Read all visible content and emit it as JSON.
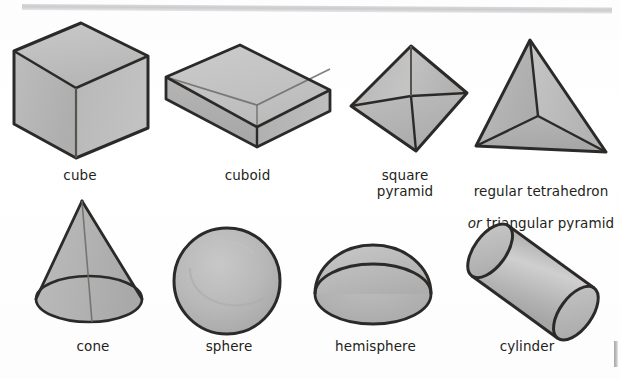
{
  "page": {
    "background_color": "#fefefe",
    "ink_color": "#231f20",
    "fill_color": "#b3b3b3",
    "fill_light": "#cfcfcf",
    "fill_dark": "#9e9e9e",
    "top_rule_color": "#cdcdd0",
    "edge_mark_color": "#9a9a9a"
  },
  "rows": [
    {
      "name": "polyhedra-row",
      "shapes": [
        {
          "id": "cube",
          "label": "cube",
          "label_lines": [
            "cube"
          ],
          "icon": "cube-icon",
          "style": "transparent-wireframe-shaded"
        },
        {
          "id": "cuboid",
          "label": "cuboid",
          "label_lines": [
            "cuboid"
          ],
          "icon": "cuboid-icon",
          "style": "transparent-wireframe-shaded"
        },
        {
          "id": "square-pyramid",
          "label": "square\npyramid",
          "label_lines": [
            "square",
            "pyramid"
          ],
          "icon": "square-pyramid-icon",
          "style": "transparent-wireframe-shaded"
        },
        {
          "id": "regular-tetrahedron",
          "label": "regular tetrahedron\nor triangular pyramid",
          "label_lines": [
            "regular tetrahedron",
            "or triangular pyramid"
          ],
          "label_line1": "regular tetrahedron",
          "label_line2_italic": "or",
          "label_line2_rest": " triangular pyramid",
          "icon": "tetrahedron-icon",
          "style": "transparent-wireframe-shaded"
        }
      ]
    },
    {
      "name": "curved-solids-row",
      "shapes": [
        {
          "id": "cone",
          "label": "cone",
          "label_lines": [
            "cone"
          ],
          "icon": "cone-icon",
          "style": "transparent-wireframe-shaded"
        },
        {
          "id": "sphere",
          "label": "sphere",
          "label_lines": [
            "sphere"
          ],
          "icon": "sphere-icon",
          "style": "solid-shaded"
        },
        {
          "id": "hemisphere",
          "label": "hemisphere",
          "label_lines": [
            "hemisphere"
          ],
          "icon": "hemisphere-icon",
          "style": "solid-shaded"
        },
        {
          "id": "cylinder",
          "label": "cylinder",
          "label_lines": [
            "cylinder"
          ],
          "icon": "cylinder-icon",
          "style": "transparent-wireframe-shaded"
        }
      ]
    }
  ]
}
